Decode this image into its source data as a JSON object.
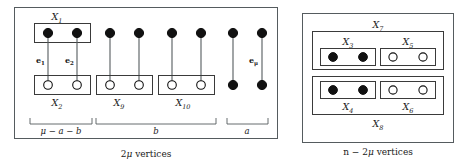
{
  "figure": {
    "left_panel": {
      "caption_prefix": "2",
      "caption_mu": "μ",
      "caption_suffix": " vertices",
      "groups": [
        {
          "id": "g1",
          "top_box_label": "X",
          "top_box_sub": "1",
          "bottom_box_label": "X",
          "bottom_box_sub": "2",
          "top_nodes": [
            "filled",
            "filled"
          ],
          "bottom_nodes": [
            "open",
            "open"
          ],
          "edges": [
            {
              "label": "e",
              "sub": "1"
            },
            {
              "label": "e",
              "sub": "2"
            }
          ]
        },
        {
          "id": "g2",
          "top_box_label": "",
          "top_box_sub": "",
          "bottom_box_label": "X",
          "bottom_box_sub": "9",
          "top_nodes": [
            "filled",
            "filled"
          ],
          "bottom_nodes": [
            "open",
            "open"
          ],
          "edges": []
        },
        {
          "id": "g3",
          "top_box_label": "",
          "top_box_sub": "",
          "bottom_box_label": "X",
          "bottom_box_sub": "10",
          "top_nodes": [
            "filled",
            "filled"
          ],
          "bottom_nodes": [
            "open",
            "open"
          ],
          "edges": []
        },
        {
          "id": "g4",
          "top_box_label": "",
          "top_box_sub": "",
          "bottom_box_label": "",
          "bottom_box_sub": "",
          "top_nodes": [
            "filled",
            "filled"
          ],
          "bottom_nodes": [
            "filled",
            "filled"
          ],
          "edges": [
            {
              "label": "",
              "sub": ""
            },
            {
              "label": "e",
              "sub": "μ"
            }
          ]
        }
      ],
      "braces": [
        {
          "id": "brace-1",
          "text": "μ − a − b"
        },
        {
          "id": "brace-2",
          "text": "b"
        },
        {
          "id": "brace-3",
          "text": "a"
        }
      ]
    },
    "right_panel": {
      "caption_prefix": "n − 2",
      "caption_mu": "μ",
      "caption_suffix": " vertices",
      "outer_top_label": "X",
      "outer_top_sub": "7",
      "outer_bottom_label": "X",
      "outer_bottom_sub": "8",
      "inner_groups": [
        {
          "id": "top-row",
          "boxes": [
            {
              "label": "X",
              "sub": "3",
              "label_pos": "above",
              "nodes": [
                "filled",
                "filled"
              ]
            },
            {
              "label": "X",
              "sub": "5",
              "label_pos": "above",
              "nodes": [
                "open",
                "open"
              ]
            }
          ]
        },
        {
          "id": "bottom-row",
          "boxes": [
            {
              "label": "X",
              "sub": "4",
              "label_pos": "below",
              "nodes": [
                "filled",
                "filled"
              ]
            },
            {
              "label": "X",
              "sub": "6",
              "label_pos": "below",
              "nodes": [
                "open",
                "open"
              ]
            }
          ]
        }
      ]
    },
    "colors": {
      "stroke": "#555b5e",
      "node_fill": "#111111",
      "node_open": "#ffffff",
      "text": "#1a1a1a",
      "background": "#ffffff"
    }
  }
}
